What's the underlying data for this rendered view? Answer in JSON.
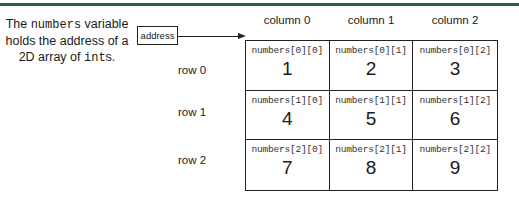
{
  "caption": {
    "part1": "The ",
    "var_name": "numbers",
    "part2": " variable holds the address of a 2D array of ",
    "type_name": "int",
    "part3": "s."
  },
  "address_box": {
    "label": "address"
  },
  "columns": [
    "column 0",
    "column 1",
    "column 2"
  ],
  "rows": [
    "row 0",
    "row 1",
    "row 2"
  ],
  "cells": [
    [
      {
        "ref": "numbers[0][0]",
        "value": "1"
      },
      {
        "ref": "numbers[0][1]",
        "value": "2"
      },
      {
        "ref": "numbers[0][2]",
        "value": "3"
      }
    ],
    [
      {
        "ref": "numbers[1][0]",
        "value": "4"
      },
      {
        "ref": "numbers[1][1]",
        "value": "5"
      },
      {
        "ref": "numbers[1][2]",
        "value": "6"
      }
    ],
    [
      {
        "ref": "numbers[2][0]",
        "value": "7"
      },
      {
        "ref": "numbers[2][1]",
        "value": "8"
      },
      {
        "ref": "numbers[2][2]",
        "value": "9"
      }
    ]
  ],
  "colors": {
    "top_rule": "#2f5d4a",
    "border": "#222222"
  }
}
